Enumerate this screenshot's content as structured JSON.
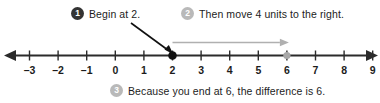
{
  "callouts": [
    {
      "badge": "1",
      "badge_style": "dark",
      "text": "Begin at 2."
    },
    {
      "badge": "2",
      "badge_style": "gray",
      "text": "Then move 4 units to the right."
    },
    {
      "badge": "3",
      "badge_style": "gray",
      "text": "Because you end at 6, the difference is 6."
    }
  ],
  "colors": {
    "axis": "#2b2b2b",
    "badge_dark": "#333333",
    "badge_gray": "#b9b9b9",
    "jump_arrow": "#b0b0b0",
    "start_point": "#111111",
    "end_point": "#a8a8a8",
    "pointer": "#111111",
    "text": "#1c1c1c"
  },
  "chart_data": {
    "type": "line",
    "xlabel": "",
    "ylabel": "",
    "xlim": [
      -3,
      9
    ],
    "grid": false,
    "tick_labels": [
      "–3",
      "–2",
      "–1",
      "0",
      "1",
      "2",
      "3",
      "4",
      "5",
      "6",
      "7",
      "8",
      "9"
    ],
    "tick_values": [
      -3,
      -2,
      -1,
      0,
      1,
      2,
      3,
      4,
      5,
      6,
      7,
      8,
      9
    ],
    "points": [
      {
        "name": "start",
        "value": 2,
        "label": "2",
        "style": "filled-black"
      },
      {
        "name": "end",
        "value": 6,
        "label": "6",
        "style": "filled-gray"
      }
    ],
    "jump": {
      "from": 2,
      "to": 6,
      "units": 4,
      "direction": "right"
    },
    "axis_arrows": [
      "left",
      "right"
    ]
  }
}
